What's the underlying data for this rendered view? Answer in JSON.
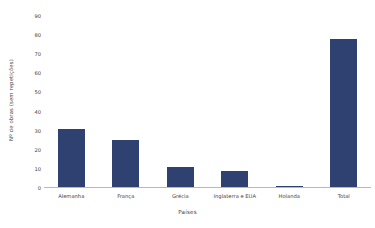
{
  "chart_data": {
    "type": "bar",
    "title": "",
    "subtitle": "",
    "xlabel": "Países",
    "ylabel": "Nº de obras (sem repetições)",
    "categories": [
      "Alemanha",
      "França",
      "Grécia",
      "Inglaterra e EUA",
      "Holanda",
      "Total"
    ],
    "values": [
      31,
      25,
      11,
      9,
      1,
      78
    ],
    "series": [
      {
        "name": "Nº de obras (sem repetições)",
        "values": [
          31,
          25,
          11,
          9,
          1,
          78
        ]
      }
    ],
    "ylim": [
      0,
      90
    ],
    "ytick_labels": [
      "0",
      "10",
      "20",
      "30",
      "40",
      "50",
      "60",
      "70",
      "80",
      "90"
    ],
    "ytick_values": [
      0,
      10,
      20,
      30,
      40,
      50,
      60,
      70,
      80,
      90
    ],
    "grid": false,
    "legend": "none",
    "bar_color": "#2e4171",
    "axis_color": "#b9b9b9",
    "text_color": "#3f3f3f",
    "background": "#ffffff"
  }
}
